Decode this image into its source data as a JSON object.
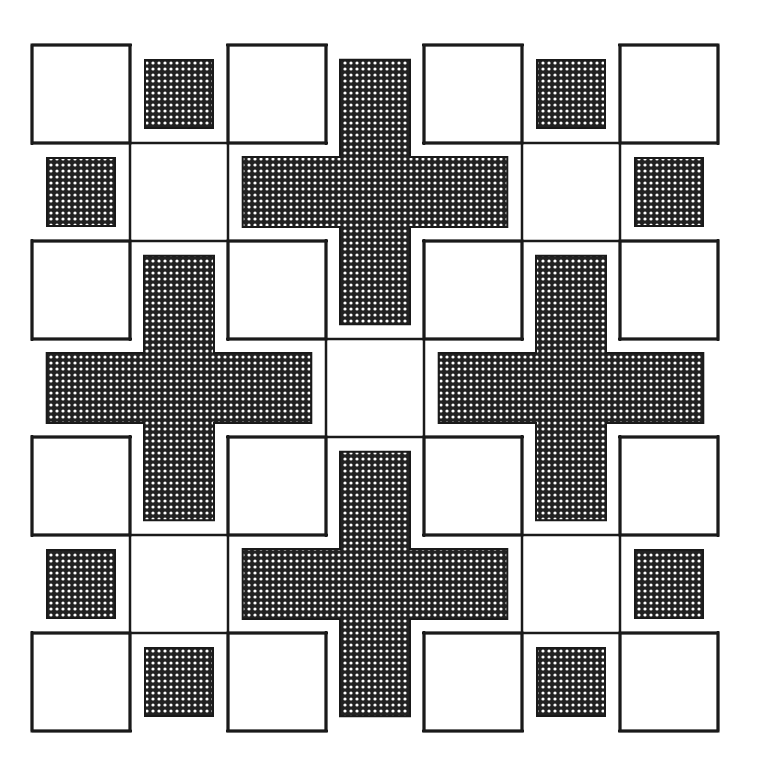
{
  "pattern": {
    "title": "Cross and square quilt block pattern",
    "grid": {
      "rows": 7,
      "cols": 7,
      "origin_x": 32,
      "origin_y": 45,
      "cell": 98
    },
    "colors": {
      "background": "#ffffff",
      "line": "#1a1a1a",
      "fill_dark": "#222222",
      "fill_dot": "#ffffff"
    },
    "white_squares": [
      [
        0,
        0
      ],
      [
        0,
        2
      ],
      [
        0,
        4
      ],
      [
        0,
        6
      ],
      [
        2,
        0
      ],
      [
        2,
        2
      ],
      [
        2,
        4
      ],
      [
        2,
        6
      ],
      [
        4,
        0
      ],
      [
        4,
        2
      ],
      [
        4,
        4
      ],
      [
        4,
        6
      ],
      [
        6,
        0
      ],
      [
        6,
        2
      ],
      [
        6,
        4
      ],
      [
        6,
        6
      ]
    ],
    "crosses": [
      {
        "row": 1,
        "col": 3
      },
      {
        "row": 3,
        "col": 1
      },
      {
        "row": 3,
        "col": 5
      },
      {
        "row": 5,
        "col": 3
      }
    ],
    "small_squares": [
      [
        0,
        1
      ],
      [
        0,
        5
      ],
      [
        1,
        0
      ],
      [
        1,
        6
      ],
      [
        5,
        0
      ],
      [
        5,
        6
      ],
      [
        6,
        1
      ],
      [
        6,
        5
      ]
    ],
    "center_cell": [
      3,
      3
    ]
  }
}
